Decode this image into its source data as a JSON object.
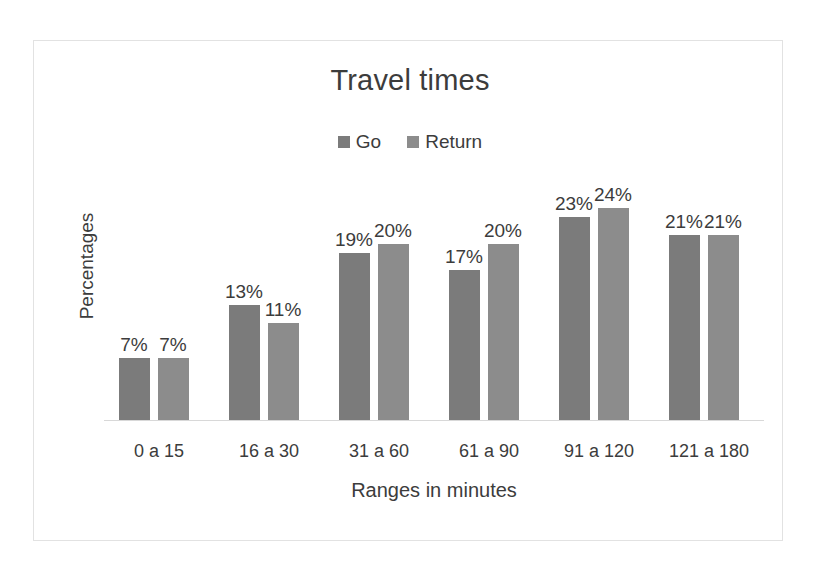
{
  "chart_data": {
    "type": "bar",
    "title": "Travel times",
    "subtitle": "",
    "xlabel": "Ranges in minutes",
    "ylabel": "Percentages",
    "categories": [
      "0 a 15",
      "16 a 30",
      "31 a 60",
      "61 a 90",
      "91 a 120",
      "121 a 180"
    ],
    "series": [
      {
        "name": "Go",
        "values": [
          7,
          13,
          19,
          17,
          23,
          21
        ],
        "color": "#7b7b7b"
      },
      {
        "name": "Return",
        "values": [
          7,
          11,
          20,
          20,
          24,
          21
        ],
        "color": "#8c8c8c"
      }
    ],
    "data_labels": {
      "Go": [
        "7%",
        "13%",
        "19%",
        "17%",
        "23%",
        "21%"
      ],
      "Return": [
        "7%",
        "11%",
        "20%",
        "20%",
        "24%",
        "21%"
      ]
    },
    "value_suffix": "%",
    "ylim": [
      0,
      29.5
    ],
    "grid": false,
    "y_ticks_visible": false,
    "legend": {
      "position": "top",
      "entries": [
        "Go",
        "Return"
      ]
    },
    "axis_line_color": "#d8d8d8",
    "frame_color": "#e2e2e2",
    "background": "#ffffff",
    "text_color": "#3c3c3c"
  },
  "legend": {
    "items": [
      {
        "label": "Go",
        "color": "#7b7b7b"
      },
      {
        "label": "Return",
        "color": "#8c8c8c"
      }
    ]
  },
  "axes": {
    "x_title": "Ranges in minutes",
    "y_title": "Percentages"
  },
  "title": "Travel times"
}
